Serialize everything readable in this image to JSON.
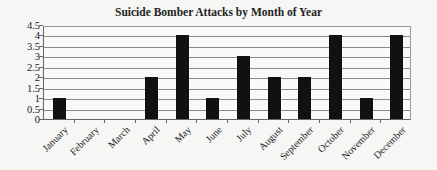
{
  "chart_data": {
    "type": "bar",
    "title": "Suicide Bomber Attacks by Month of Year",
    "xlabel": "",
    "ylabel": "",
    "categories": [
      "January",
      "February",
      "March",
      "April",
      "May",
      "June",
      "July",
      "August",
      "September",
      "October",
      "November",
      "December"
    ],
    "values": [
      1,
      0,
      0,
      2,
      4,
      1,
      3,
      2,
      2,
      4,
      1,
      4
    ],
    "ylim": [
      0,
      4.5
    ],
    "yticks": [
      "0",
      "0.5",
      "1",
      "1.5",
      "2",
      "2.5",
      "3",
      "3.5",
      "4",
      "4.5"
    ],
    "grid": true,
    "legend": null,
    "bar_color": "#111111"
  }
}
